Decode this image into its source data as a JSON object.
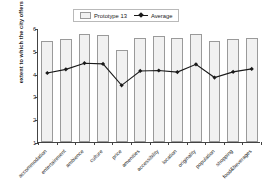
{
  "chart_data": {
    "type": "bar",
    "title": "",
    "xlabel": "",
    "ylabel": "extent to which the city offers attributes",
    "ylim": [
      1,
      6
    ],
    "yticks": [
      1,
      2,
      3,
      4,
      5,
      6
    ],
    "grid": false,
    "legend_position": "top-center",
    "categories": [
      "accommodation",
      "entertainment",
      "ambience",
      "culture",
      "price",
      "amenities",
      "accessibility",
      "location",
      "originality",
      "population",
      "shopping",
      "food&beverages"
    ],
    "series": [
      {
        "name": "Prototype 13",
        "type": "bar",
        "values": [
          5.45,
          5.5,
          5.72,
          5.7,
          5.05,
          5.55,
          5.67,
          5.58,
          5.72,
          5.45,
          5.5,
          5.58
        ]
      },
      {
        "name": "Average",
        "type": "line",
        "values": [
          4.07,
          4.23,
          4.5,
          4.47,
          3.53,
          4.16,
          4.18,
          4.11,
          4.45,
          3.87,
          4.12,
          4.25
        ]
      }
    ]
  },
  "legend": {
    "bar_label": "Prototype 13",
    "line_label": "Average"
  },
  "colors": {
    "bar_fill": "#f1f1f1",
    "bar_stroke": "#9a9a9a",
    "line": "#1a1a1a",
    "axis": "#444444",
    "text": "#1a1a1a",
    "background": "#ffffff"
  }
}
